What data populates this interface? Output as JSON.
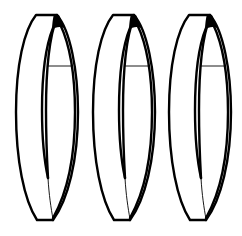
{
  "figure": {
    "background": "#ffffff",
    "stroke_color": "#000000",
    "rings": [
      {
        "id": "ring-1",
        "offset_x": 0
      },
      {
        "id": "ring-2",
        "offset_x": 77
      },
      {
        "id": "ring-3",
        "offset_x": 153
      }
    ]
  }
}
